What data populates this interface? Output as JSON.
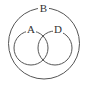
{
  "diagram": {
    "type": "venn",
    "sets": [
      {
        "id": "outer",
        "label": "B"
      },
      {
        "id": "left",
        "label": "A"
      },
      {
        "id": "right",
        "label": "D"
      }
    ],
    "relations": "A and D overlap; both contained in B",
    "colors": {
      "stroke": "#555555",
      "background": "#ffffff"
    }
  }
}
